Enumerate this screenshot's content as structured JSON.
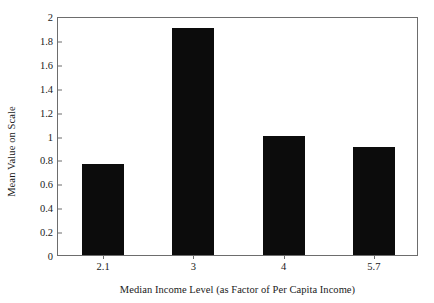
{
  "chart_data": {
    "type": "bar",
    "title": "",
    "xlabel": "Median Income Level (as Factor of Per Capita Income)",
    "ylabel": "Mean Value on Scale",
    "categories": [
      "2.1",
      "3",
      "4",
      "5.7"
    ],
    "values": [
      0.76,
      1.9,
      1.0,
      0.9
    ],
    "ylim": [
      0,
      2
    ],
    "yticks": [
      "0",
      "0.2",
      "0.4",
      "0.6",
      "0.8",
      "1",
      "1.2",
      "1.4",
      "1.6",
      "1.8",
      "2"
    ],
    "ytick_values": [
      0,
      0.2,
      0.4,
      0.6,
      0.8,
      1,
      1.2,
      1.4,
      1.6,
      1.8,
      2
    ],
    "grid": false,
    "legend": "none",
    "bar_color": "#0c0c0c",
    "axis_color": "#6d6d6d",
    "background": "#ffffff"
  }
}
